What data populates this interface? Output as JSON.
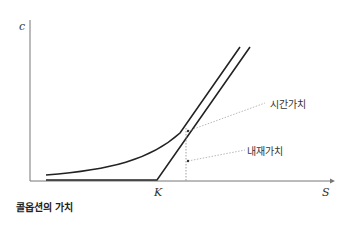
{
  "diagram": {
    "y_axis_label": "c",
    "x_axis_label": "S",
    "strike_label": "K",
    "annotations": {
      "time_value": "시간가치",
      "intrinsic_value": "내재가치"
    },
    "caption": "콜옵션의 가치"
  }
}
